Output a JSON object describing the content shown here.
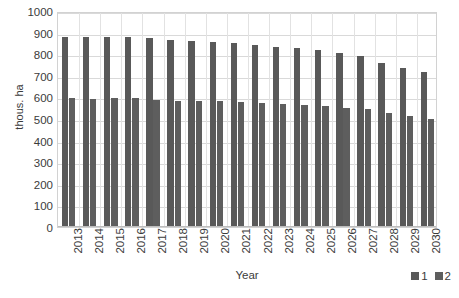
{
  "chart_data": {
    "type": "bar",
    "title": "",
    "xlabel": "Year",
    "ylabel": "thous. ha",
    "ylim": [
      0,
      1000
    ],
    "ytick_step": 100,
    "grid": true,
    "legend_position": "bottom-right",
    "categories": [
      "2013",
      "2014",
      "2015",
      "2016",
      "2017",
      "2018",
      "2019",
      "2020",
      "2021",
      "2022",
      "2023",
      "2024",
      "2025",
      "2026",
      "2027",
      "2028",
      "2029",
      "2030"
    ],
    "yticks": [
      "0",
      "100",
      "200",
      "300",
      "400",
      "500",
      "600",
      "700",
      "800",
      "900",
      "1000"
    ],
    "series": [
      {
        "name": "1",
        "color": "#595959",
        "values": [
          880,
          878,
          880,
          878,
          873,
          868,
          862,
          858,
          850,
          843,
          835,
          828,
          818,
          805,
          790,
          760,
          735,
          718
        ]
      },
      {
        "name": "2",
        "color": "#5e5e5e",
        "values": [
          595,
          593,
          595,
          595,
          588,
          585,
          582,
          582,
          578,
          575,
          570,
          565,
          558,
          550,
          545,
          528,
          512,
          500
        ]
      }
    ]
  },
  "legend": {
    "items": [
      {
        "label": "1",
        "color": "#595959"
      },
      {
        "label": "2",
        "color": "#5e5e5e"
      }
    ]
  }
}
